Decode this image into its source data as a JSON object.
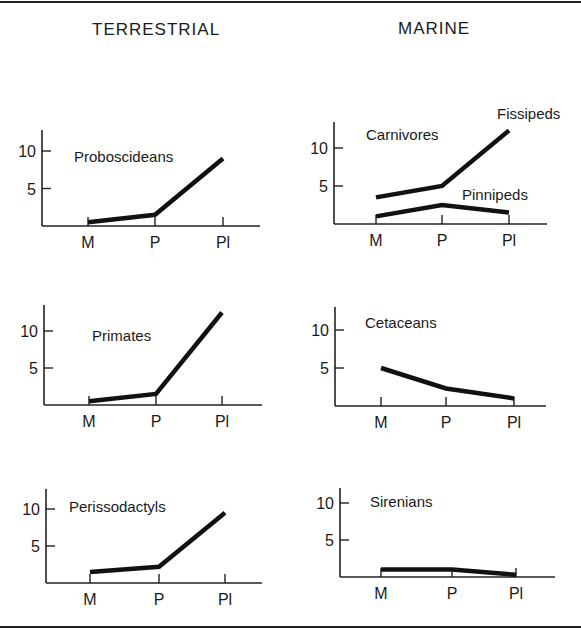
{
  "columns": {
    "left_title": "TERRESTRIAL",
    "right_title": "MARINE"
  },
  "chart_data": [
    {
      "type": "line",
      "group": "TERRESTRIAL",
      "title": "Proboscideans",
      "categories": [
        "M",
        "P",
        "Pl"
      ],
      "series": [
        {
          "name": "Proboscideans",
          "values": [
            0.5,
            1.5,
            9
          ]
        }
      ],
      "yticks": [
        "5",
        "10"
      ],
      "ylim": [
        0,
        12
      ],
      "grid": false,
      "layout": {
        "ox": 42,
        "oy": 226,
        "ppu": 7.5,
        "xs": [
          88,
          155,
          223
        ],
        "xend": 260,
        "ytop": 130
      }
    },
    {
      "type": "line",
      "group": "MARINE",
      "title": "Carnivores",
      "categories": [
        "M",
        "P",
        "Pl"
      ],
      "series": [
        {
          "name": "Fissipeds",
          "values": [
            3.5,
            5,
            12.3
          ]
        },
        {
          "name": "Pinnipeds",
          "values": [
            1,
            2.5,
            1.5
          ]
        }
      ],
      "yticks": [
        "5",
        "10"
      ],
      "ylim": [
        0,
        12
      ],
      "grid": false,
      "layout": {
        "ox": 334,
        "oy": 224,
        "ppu": 7.6,
        "xs": [
          376,
          442,
          509
        ],
        "xend": 547,
        "ytop": 122
      }
    },
    {
      "type": "line",
      "group": "TERRESTRIAL",
      "title": "Primates",
      "categories": [
        "M",
        "P",
        "Pl"
      ],
      "series": [
        {
          "name": "Primates",
          "values": [
            0.5,
            1.5,
            12.5
          ]
        }
      ],
      "yticks": [
        "5",
        "10"
      ],
      "ylim": [
        0,
        12
      ],
      "grid": false,
      "layout": {
        "ox": 44,
        "oy": 405,
        "ppu": 7.4,
        "xs": [
          89,
          156,
          222
        ],
        "xend": 262,
        "ytop": 305
      }
    },
    {
      "type": "line",
      "group": "MARINE",
      "title": "Cetaceans",
      "categories": [
        "M",
        "P",
        "Pl"
      ],
      "series": [
        {
          "name": "Cetaceans",
          "values": [
            5,
            2.3,
            1
          ]
        }
      ],
      "yticks": [
        "5",
        "10"
      ],
      "ylim": [
        0,
        12
      ],
      "grid": false,
      "layout": {
        "ox": 335,
        "oy": 406,
        "ppu": 7.6,
        "xs": [
          381,
          446,
          514
        ],
        "xend": 546,
        "ytop": 307
      }
    },
    {
      "type": "line",
      "group": "TERRESTRIAL",
      "title": "Perissodactyls",
      "categories": [
        "M",
        "P",
        "Pl"
      ],
      "series": [
        {
          "name": "Perissodactyls",
          "values": [
            1.5,
            2.2,
            9.5
          ]
        }
      ],
      "yticks": [
        "5",
        "10"
      ],
      "ylim": [
        0,
        12
      ],
      "grid": false,
      "layout": {
        "ox": 46,
        "oy": 583,
        "ppu": 7.4,
        "xs": [
          90,
          159,
          225
        ],
        "xend": 262,
        "ytop": 489
      }
    },
    {
      "type": "line",
      "group": "MARINE",
      "title": "Sirenians",
      "categories": [
        "M",
        "P",
        "Pl"
      ],
      "series": [
        {
          "name": "Sirenians",
          "values": [
            1,
            1,
            0.3
          ]
        }
      ],
      "yticks": [
        "5",
        "10"
      ],
      "ylim": [
        0,
        12
      ],
      "grid": false,
      "layout": {
        "ox": 340,
        "oy": 577,
        "ppu": 7.4,
        "xs": [
          381,
          452,
          516
        ],
        "xend": 555,
        "ytop": 488
      }
    }
  ],
  "labels": {
    "proboscideans": "Proboscideans",
    "carnivores": "Carnivores",
    "fissipeds": "Fissipeds",
    "pinnipeds": "Pinnipeds",
    "primates": "Primates",
    "cetaceans": "Cetaceans",
    "perissodactyls": "Perissodactyls",
    "sirenians": "Sirenians"
  }
}
